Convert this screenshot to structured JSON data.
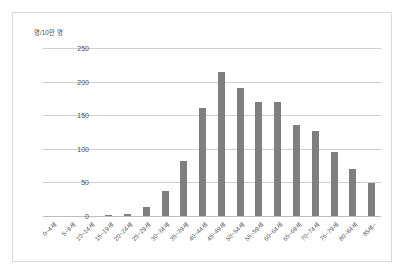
{
  "chart_data": {
    "type": "bar",
    "title": "",
    "subtitle": "",
    "xlabel": "",
    "ylabel": "명/10만 명",
    "ylim": [
      0,
      250
    ],
    "yticks": [
      0,
      50,
      100,
      150,
      200,
      250
    ],
    "grid": true,
    "legend": false,
    "legend_position": "none",
    "bar_color": "#7f7f7f",
    "categories": [
      "0~4세",
      "5~9세",
      "10~14세",
      "15~19세",
      "20~24세",
      "25~29세",
      "30~34세",
      "35~39세",
      "40~44세",
      "45~49세",
      "50~54세",
      "55~59세",
      "60~64세",
      "65~69세",
      "70~74세",
      "75~79세",
      "80~84세",
      "85세~"
    ],
    "values": [
      0,
      0,
      0,
      1,
      3,
      13,
      37,
      82,
      161,
      215,
      190,
      170,
      170,
      135,
      127,
      95,
      70,
      49
    ]
  },
  "axis": {
    "y_unit_caption": "명/10만 명",
    "tick_labels": [
      "250",
      "200",
      "150",
      "100",
      "50",
      "0"
    ]
  }
}
